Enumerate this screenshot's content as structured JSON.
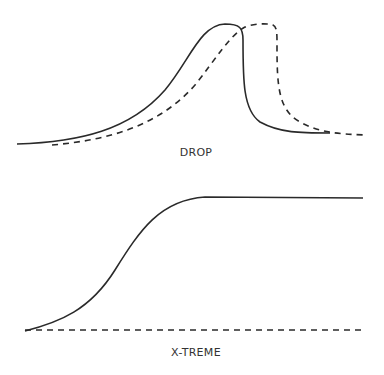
{
  "diagrams": [
    {
      "label": "DROP",
      "series": [
        {
          "name": "solid",
          "style": "solid",
          "shape": "rises gradually to a peak then drops sharply to a low plateau"
        },
        {
          "name": "dashed",
          "style": "dashed",
          "shape": "lags solid curve, reaches flat peak later, then drops sharply"
        }
      ]
    },
    {
      "label": "X-TREME",
      "series": [
        {
          "name": "solid",
          "style": "solid",
          "shape": "S-curve rising from baseline to a high flat plateau"
        },
        {
          "name": "dashed",
          "style": "dashed",
          "shape": "flat baseline"
        }
      ]
    }
  ],
  "colors": {
    "line": "#2a2a2a",
    "background": "#ffffff"
  }
}
